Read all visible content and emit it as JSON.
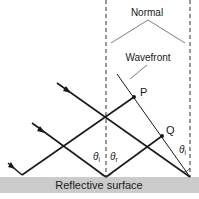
{
  "diagram": {
    "labels": {
      "normal": "Normal",
      "wavefront": "Wavefront",
      "point_p": "P",
      "point_q": "Q",
      "theta_i_left": "θ",
      "theta_i_left_sub": "i",
      "theta_r": "θ",
      "theta_r_sub": "r",
      "theta_i_right": "θ",
      "theta_i_right_sub": "i",
      "surface": "Reflective surface"
    },
    "colors": {
      "surface": "#c8c8c8",
      "ray": "#1a1a1a",
      "background": "#ffffff"
    }
  }
}
